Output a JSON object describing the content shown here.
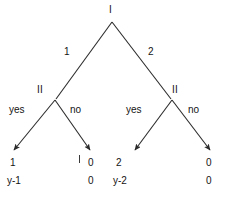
{
  "figure": {
    "type": "game-tree",
    "background_color": "#ffffff",
    "line_color": "#2b2b2b",
    "text_color": "#141414"
  },
  "nodes": {
    "root": {
      "label": "I",
      "x": 112,
      "y": 21,
      "label_x": 109,
      "label_y": 6
    },
    "left_second": {
      "label": "II",
      "x": 55,
      "y": 100,
      "label_x": 38,
      "label_y": 86
    },
    "right_second": {
      "label": "II",
      "x": 172,
      "y": 100,
      "label_x": 172,
      "label_y": 86
    }
  },
  "branch_labels": {
    "root_left": {
      "text": "1",
      "x": 64,
      "y": 48
    },
    "root_right": {
      "text": "2",
      "x": 148,
      "y": 48
    },
    "left_yes": {
      "text": "yes",
      "x": 9,
      "y": 106
    },
    "left_no": {
      "text": "no",
      "x": 70,
      "y": 106
    },
    "right_yes": {
      "text": "yes",
      "x": 126,
      "y": 106
    },
    "right_no": {
      "text": "no",
      "x": 188,
      "y": 106
    }
  },
  "leaves": [
    {
      "name": "leaf-yes-yes",
      "arrow_end_x": 12,
      "arrow_end_y": 152,
      "top_payoff": "1",
      "bottom_payoff": "y-1",
      "top_x": 10,
      "top_y": 159,
      "bottom_x": 7,
      "bottom_y": 177
    },
    {
      "name": "leaf-yes-no",
      "arrow_end_x": 92,
      "arrow_end_y": 152,
      "top_payoff": "0",
      "bottom_payoff": "0",
      "top_x": 88,
      "top_y": 159,
      "bottom_x": 88,
      "bottom_y": 177
    },
    {
      "name": "leaf-no-yes",
      "arrow_end_x": 133,
      "arrow_end_y": 152,
      "top_payoff": "2",
      "bottom_payoff": "y-2",
      "top_x": 116,
      "top_y": 159,
      "bottom_x": 113,
      "bottom_y": 177
    },
    {
      "name": "leaf-no-no",
      "arrow_end_x": 212,
      "arrow_end_y": 152,
      "top_payoff": "0",
      "bottom_payoff": "0",
      "top_x": 206,
      "top_y": 159,
      "bottom_x": 206,
      "bottom_y": 177
    }
  ],
  "artifacts": {
    "stray_tick": {
      "label": "I",
      "x": 79,
      "y": 155
    }
  }
}
